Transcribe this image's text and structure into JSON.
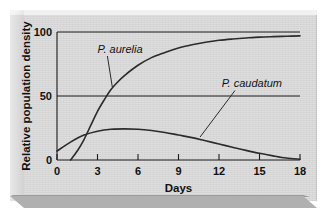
{
  "chart_data": {
    "type": "line",
    "title": "",
    "subtitle": "",
    "xlabel": "Days",
    "ylabel": "Relative population density",
    "xlim": [
      0,
      18
    ],
    "ylim": [
      0,
      100
    ],
    "xticks": [
      "0",
      "3",
      "6",
      "9",
      "12",
      "15",
      "18"
    ],
    "xtick_values": [
      0,
      3,
      6,
      9,
      12,
      15,
      18
    ],
    "yticks": [
      "0",
      "50",
      "100"
    ],
    "ytick_values": [
      0,
      50,
      100
    ],
    "grid": "horizontal gridlines at y = 50 and y = 100",
    "legend": "inline curve labels with leader lines",
    "annotations": [
      {
        "text": "P. aurelia",
        "x_text": 3.0,
        "y_text": 84,
        "leader_to_x": 4.1,
        "leader_to_y": 57
      },
      {
        "text": "P. caudatum",
        "x_text": 12.2,
        "y_text": 57,
        "leader_to_x": 10.6,
        "leader_to_y": 18
      }
    ],
    "series": [
      {
        "name": "P. aurelia",
        "color": "#2b2b2b",
        "x": [
          1.0,
          1.5,
          2.0,
          2.5,
          3.0,
          3.5,
          4.0,
          4.5,
          5.0,
          6.0,
          7.0,
          8.0,
          9.0,
          10.0,
          11.0,
          12.0,
          13.0,
          14.0,
          15.0,
          16.0,
          17.0,
          18.0
        ],
        "values": [
          0,
          7,
          16,
          27,
          38,
          47,
          55,
          61,
          66,
          74,
          80,
          84,
          87.5,
          90,
          92,
          93.5,
          94.5,
          95.3,
          96,
          96.4,
          96.7,
          97
        ]
      },
      {
        "name": "P. caudatum",
        "color": "#2b2b2b",
        "x": [
          0.0,
          1.0,
          2.0,
          3.0,
          4.0,
          5.0,
          6.0,
          7.0,
          8.0,
          9.0,
          10.0,
          11.0,
          12.0,
          13.0,
          14.0,
          15.0,
          16.0,
          17.0,
          18.0
        ],
        "values": [
          7,
          14,
          19.5,
          22.5,
          24,
          24.3,
          24,
          23,
          21.5,
          19.5,
          17.5,
          15,
          12.5,
          10,
          7.5,
          5.2,
          3.2,
          1.5,
          0.6
        ]
      }
    ]
  },
  "axis": {
    "y_title": "Relative population density",
    "x_title": "Days"
  },
  "labels": {
    "aurelia": "P. aurelia",
    "caudatum": "P. caudatum"
  },
  "colors": {
    "background": "#dcdcdc",
    "frame_light": "#f1f1f1",
    "frame_dark": "#b0b0b0",
    "ink": "#1a1a1a",
    "curve": "#2b2b2b"
  }
}
